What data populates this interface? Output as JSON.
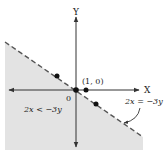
{
  "diagram": {
    "type": "linear-inequality-graph",
    "axes": {
      "x_label": "X",
      "y_label": "Y",
      "origin_label": "0"
    },
    "boundary_line": {
      "equation": "2x = −3y",
      "style": "dashed"
    },
    "shaded_region": {
      "inequality": "2x < −3y"
    },
    "points": [
      {
        "label": "(1, 0)",
        "x": 1,
        "y": 0
      }
    ],
    "colors": {
      "shade": "#e3e3e3",
      "line": "#555555",
      "axis": "#333333",
      "point": "#111111"
    }
  }
}
